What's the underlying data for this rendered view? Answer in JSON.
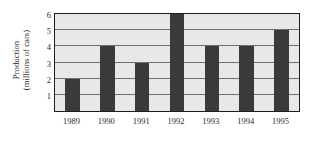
{
  "chart_data": {
    "type": "bar",
    "title": "",
    "xlabel": "",
    "ylabel": "Production (millions of cars)",
    "ylabel_lines": [
      "Production",
      "(millions of cars)"
    ],
    "categories": [
      "1989",
      "1990",
      "1991",
      "1992",
      "1993",
      "1994",
      "1995"
    ],
    "values": [
      2,
      4,
      3,
      6,
      4,
      4,
      5
    ],
    "ylim": [
      0,
      6
    ],
    "yticks": [
      1,
      2,
      3,
      4,
      5,
      6
    ],
    "ytick_labels": [
      "1",
      "2",
      "3",
      "4",
      "5",
      "6"
    ],
    "grid": true,
    "legend": null,
    "colors": {
      "bar": "#3a3a3a",
      "plot_background": "#e8e8e8",
      "gridline": "#6f6f6f",
      "axis_border": "#1c1c1c",
      "text": "#2b2b2b",
      "figure_background": "#ffffff"
    }
  }
}
